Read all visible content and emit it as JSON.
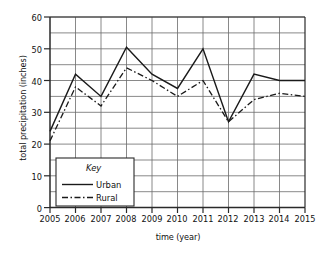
{
  "chart_data": {
    "type": "line",
    "title": "",
    "xlabel": "time (year)",
    "ylabel": "total precipitation (inches)",
    "x": [
      2005,
      2006,
      2007,
      2008,
      2009,
      2010,
      2011,
      2012,
      2013,
      2014,
      2015
    ],
    "xtick_labels": [
      "2005",
      "2006",
      "2007",
      "2008",
      "2009",
      "2010",
      "2011",
      "2012",
      "2013",
      "2014",
      "2015"
    ],
    "ytick_labels": [
      "0",
      "10",
      "20",
      "30",
      "40",
      "50",
      "60"
    ],
    "ytick_values": [
      0,
      10,
      20,
      30,
      40,
      50,
      60
    ],
    "ylim": [
      0,
      60
    ],
    "xlim": [
      2005,
      2015
    ],
    "minor_gridline_step": 5,
    "grid": "both",
    "legend_position": "inside-bottom-left",
    "legend_title": "Key",
    "series": [
      {
        "name": "Urban",
        "style": "solid",
        "color": "#1a1a1a",
        "values": [
          24,
          42,
          35,
          50.5,
          42,
          37.5,
          50,
          27,
          42,
          40,
          40
        ]
      },
      {
        "name": "Rural",
        "style": "dash-dot",
        "color": "#1a1a1a",
        "values": [
          21,
          38,
          32,
          44,
          40,
          35,
          40,
          27,
          34,
          36,
          35
        ]
      }
    ]
  },
  "legend": {
    "title": "Key",
    "entries": [
      {
        "label": "Urban",
        "style": "solid"
      },
      {
        "label": "Rural",
        "style": "dash-dot"
      }
    ]
  },
  "colors": {
    "ink": "#1a1a1a",
    "gridline": "#6b6b6b",
    "axis": "#2a2a2a",
    "background": "#ffffff"
  }
}
